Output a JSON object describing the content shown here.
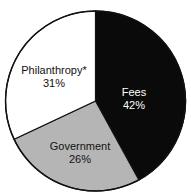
{
  "figure": {
    "title_remnant": "",
    "background_color": "#ffffff",
    "outline_color": "#111111"
  },
  "chart_data": {
    "type": "pie",
    "title": "",
    "xlabel": "",
    "ylabel": "",
    "legend_position": "none",
    "grid": false,
    "start_angle_deg": 0,
    "direction": "clockwise",
    "categories": [
      "Fees",
      "Government",
      "Philanthropy*"
    ],
    "values": [
      42,
      26,
      31
    ],
    "value_unit": "%",
    "colors": [
      "#0a0a0a",
      "#b5b5b5",
      "#ffffff"
    ],
    "label_text_colors": [
      "#ffffff",
      "#111111",
      "#111111"
    ],
    "footnote_marker": "*",
    "slices": [
      {
        "name": "Fees",
        "value": 42,
        "value_label": "42%",
        "color": "#0a0a0a",
        "text_color": "#ffffff",
        "start_deg": 0,
        "end_deg": 151.2
      },
      {
        "name": "Government",
        "value": 26,
        "value_label": "26%",
        "color": "#b5b5b5",
        "text_color": "#111111",
        "start_deg": 151.2,
        "end_deg": 244.8
      },
      {
        "name": "Philanthropy*",
        "value": 31,
        "value_label": "31%",
        "color": "#ffffff",
        "text_color": "#111111",
        "start_deg": 244.8,
        "end_deg": 360
      }
    ]
  },
  "labels": {
    "fees": {
      "name": "Fees",
      "value": "42%"
    },
    "government": {
      "name": "Government",
      "value": "26%"
    },
    "philanthropy": {
      "name": "Philanthropy*",
      "value": "31%"
    }
  }
}
